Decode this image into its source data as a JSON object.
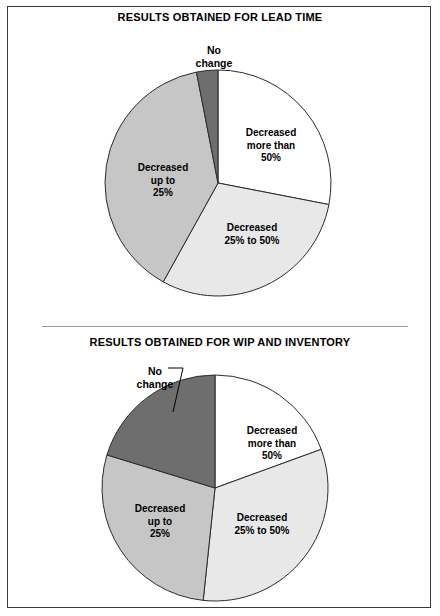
{
  "figure": {
    "background_color": "#ffffff",
    "frame_color": "#3a3a3a",
    "divider_color": "#9a9a9a"
  },
  "charts": [
    {
      "id": "lead-time",
      "title": "RESULTS OBTAINED FOR LEAD TIME",
      "center": {
        "x": 218,
        "y": 183
      },
      "radius": 113,
      "slices": [
        {
          "key": "decreased-more-than-50",
          "label_lines": [
            "Decreased",
            "more than",
            "50%"
          ],
          "label_x": 271,
          "label_y": 127,
          "start_angle": 0,
          "end_angle": 101,
          "value": 28.1,
          "color": "#ffffff"
        },
        {
          "key": "decreased-25-to-50",
          "label_lines": [
            "Decreased",
            "25% to 50%"
          ],
          "label_x": 252,
          "label_y": 222,
          "start_angle": 101,
          "end_angle": 209,
          "value": 30.0,
          "color": "#e8e8e8"
        },
        {
          "key": "decreased-up-to-25",
          "label_lines": [
            "Decreased",
            "up to",
            "25%"
          ],
          "label_x": 163,
          "label_y": 162,
          "start_angle": 209,
          "end_angle": 349,
          "value": 38.9,
          "color": "#c6c6c6"
        },
        {
          "key": "no-change",
          "label_lines": [
            "No",
            "change"
          ],
          "label_x": 214,
          "label_y": 44,
          "start_angle": 349,
          "end_angle": 360,
          "value": 3.0,
          "color": "#6e6e6e"
        }
      ],
      "leader": null
    },
    {
      "id": "wip-and-inventory",
      "title": "RESULTS OBTAINED FOR WIP AND INVENTORY",
      "center": {
        "x": 215,
        "y": 488
      },
      "radius": 113,
      "slices": [
        {
          "key": "decreased-more-than-50",
          "label_lines": [
            "Decreased",
            "more than",
            "50%"
          ],
          "label_x": 272,
          "label_y": 425,
          "start_angle": 0,
          "end_angle": 70,
          "value": 19.4,
          "color": "#ffffff"
        },
        {
          "key": "decreased-25-to-50",
          "label_lines": [
            "Decreased",
            "25% to 50%"
          ],
          "label_x": 262,
          "label_y": 512,
          "start_angle": 70,
          "end_angle": 186,
          "value": 32.2,
          "color": "#e8e8e8"
        },
        {
          "key": "decreased-up-to-25",
          "label_lines": [
            "Decreased",
            "up to",
            "25%"
          ],
          "label_x": 160,
          "label_y": 503,
          "start_angle": 186,
          "end_angle": 287,
          "value": 28.1,
          "color": "#c6c6c6"
        },
        {
          "key": "no-change",
          "label_lines": [
            "No",
            "change"
          ],
          "label_x": 155,
          "label_y": 365,
          "start_angle": 287,
          "end_angle": 360,
          "value": 20.3,
          "color": "#6e6e6e"
        }
      ],
      "leader": {
        "x1": 168,
        "y1": 368,
        "x2": 183,
        "y2": 368,
        "x3": 173,
        "y3": 412
      }
    }
  ],
  "chart_data": {
    "type": "pie",
    "categories": [
      "Decreased more than 50%",
      "Decreased 25% to 50%",
      "Decreased up to 25%",
      "No change"
    ],
    "colors": [
      "#ffffff",
      "#e8e8e8",
      "#c6c6c6",
      "#6e6e6e"
    ],
    "legend": "inside-slice-labels",
    "grid": false,
    "series": [
      {
        "name": "RESULTS OBTAINED FOR LEAD TIME",
        "values": [
          28.1,
          30.0,
          38.9,
          3.0
        ],
        "units": "percent of respondents",
        "slice_angles_deg": [
          101,
          108,
          140,
          11
        ]
      },
      {
        "name": "RESULTS OBTAINED FOR WIP AND INVENTORY",
        "values": [
          19.4,
          32.2,
          28.1,
          20.3
        ],
        "units": "percent of respondents",
        "slice_angles_deg": [
          70,
          116,
          101,
          73
        ]
      }
    ]
  }
}
